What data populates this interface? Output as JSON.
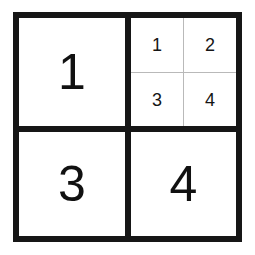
{
  "figure": {
    "background_color": "#ffffff",
    "frame_color": "#161616",
    "subgrid_line_color": "#b9b9b9",
    "digit_color": "#111111"
  },
  "quadrants": [
    {
      "position": "top-left",
      "label": "1",
      "type": "digit"
    },
    {
      "position": "top-right",
      "label": "",
      "type": "nested-grid"
    },
    {
      "position": "bottom-left",
      "label": "3",
      "type": "digit"
    },
    {
      "position": "bottom-right",
      "label": "4",
      "type": "digit"
    }
  ],
  "subgrid": {
    "rows": 2,
    "columns": 2,
    "cells": [
      {
        "position": "top-left",
        "label": "1"
      },
      {
        "position": "top-right",
        "label": "2"
      },
      {
        "position": "bottom-left",
        "label": "3"
      },
      {
        "position": "bottom-right",
        "label": "4"
      }
    ]
  }
}
